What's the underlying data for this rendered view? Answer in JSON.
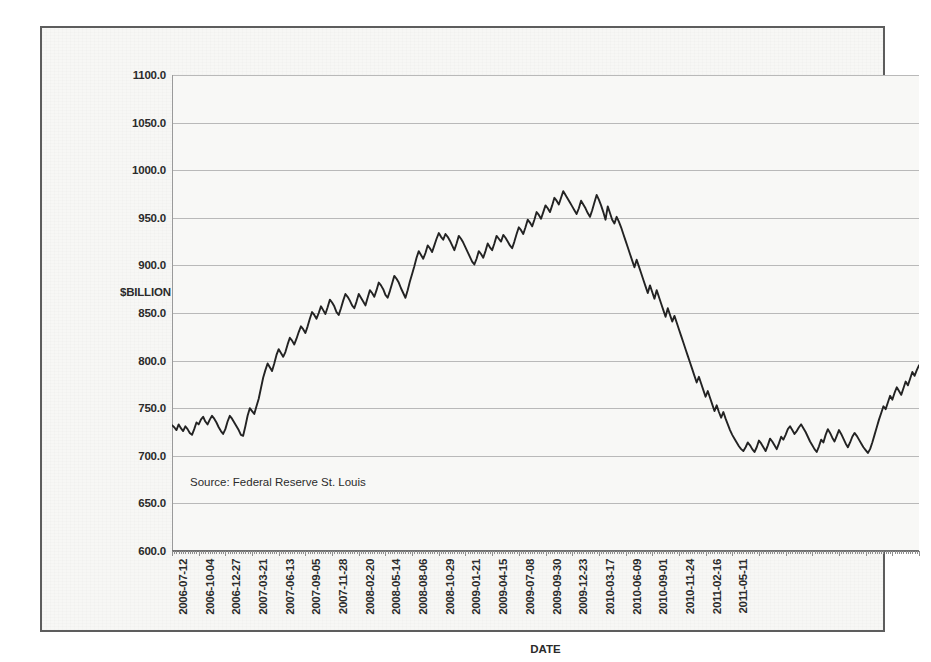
{
  "chart_data": {
    "type": "line",
    "title": "U.S. Commercial and Industrial Loans plus Non- financial Commercial Paper",
    "xlabel": "DATE",
    "ylabel": "$BILLION",
    "ylim": [
      600.0,
      1100.0
    ],
    "ytick_step": 50.0,
    "ytick_labels": [
      "1100.0",
      "1050.0",
      "1000.0",
      "950.0",
      "900.0",
      "850.0",
      "800.0",
      "750.0",
      "700.0",
      "650.0",
      "600.0"
    ],
    "ytick_values": [
      1100.0,
      1050.0,
      1000.0,
      950.0,
      900.0,
      850.0,
      800.0,
      750.0,
      700.0,
      650.0,
      600.0
    ],
    "grid": true,
    "legend": "none",
    "annotation": "Source: Federal Reserve St. Louis",
    "line_color": "#232323",
    "xtick_labels": [
      "2006-07-12",
      "2006-10-04",
      "2006-12-27",
      "2007-03-21",
      "2007-06-13",
      "2007-09-05",
      "2007-11-28",
      "2008-02-20",
      "2008-05-14",
      "2008-08-06",
      "2008-10-29",
      "2009-01-21",
      "2009-04-15",
      "2009-07-08",
      "2009-09-30",
      "2009-12-23",
      "2010-03-17",
      "2010-06-09",
      "2010-09-01",
      "2010-11-24",
      "2011-02-16",
      "2011-05-11"
    ],
    "x_start": "2006-07-12",
    "x_end": "2011-07-27",
    "x_interval": "weekly",
    "n_points": 260,
    "values": [
      732,
      730,
      727,
      733,
      729,
      726,
      731,
      728,
      724,
      722,
      728,
      735,
      733,
      738,
      741,
      736,
      733,
      738,
      742,
      739,
      735,
      730,
      726,
      723,
      728,
      736,
      742,
      739,
      735,
      731,
      727,
      722,
      721,
      731,
      742,
      750,
      747,
      744,
      752,
      760,
      771,
      782,
      790,
      797,
      793,
      789,
      797,
      806,
      812,
      808,
      804,
      809,
      817,
      824,
      821,
      817,
      823,
      830,
      836,
      833,
      829,
      836,
      844,
      851,
      848,
      844,
      850,
      857,
      853,
      849,
      856,
      864,
      861,
      857,
      851,
      848,
      855,
      863,
      870,
      867,
      863,
      858,
      855,
      862,
      870,
      866,
      862,
      858,
      866,
      874,
      871,
      867,
      874,
      882,
      879,
      875,
      869,
      866,
      873,
      881,
      889,
      886,
      882,
      876,
      871,
      866,
      874,
      883,
      891,
      899,
      908,
      915,
      911,
      907,
      913,
      921,
      918,
      914,
      921,
      928,
      934,
      930,
      927,
      933,
      930,
      926,
      921,
      916,
      923,
      931,
      928,
      924,
      919,
      914,
      909,
      904,
      901,
      907,
      915,
      912,
      908,
      915,
      923,
      919,
      916,
      923,
      931,
      928,
      925,
      932,
      929,
      925,
      921,
      918,
      925,
      933,
      940,
      937,
      933,
      940,
      948,
      945,
      941,
      948,
      956,
      953,
      949,
      956,
      963,
      960,
      956,
      963,
      971,
      968,
      964,
      971,
      978,
      974,
      970,
      966,
      962,
      958,
      954,
      960,
      968,
      964,
      960,
      955,
      951,
      958,
      966,
      974,
      969,
      963,
      956,
      948,
      962,
      955,
      948,
      944,
      951,
      946,
      940,
      933,
      926,
      919,
      912,
      905,
      898,
      906,
      899,
      892,
      885,
      878,
      871,
      879,
      872,
      865,
      874,
      867,
      860,
      853,
      846,
      855,
      848,
      841,
      847,
      840,
      833,
      826,
      819,
      812,
      805,
      798,
      791,
      784,
      777,
      783,
      776,
      769,
      762,
      768,
      761,
      754,
      747,
      753,
      746,
      740,
      746,
      739,
      733,
      727,
      722,
      718,
      714,
      710,
      707,
      705,
      709,
      714
    ],
    "tail_values": [
      711,
      707,
      704,
      709,
      716,
      713,
      709,
      705,
      711,
      718,
      715,
      711,
      707,
      713,
      720,
      717,
      722,
      728,
      731,
      727,
      723,
      726,
      730,
      733,
      729,
      725,
      720,
      715,
      711,
      707,
      704,
      710,
      717,
      714,
      722,
      728,
      724,
      719,
      715,
      721,
      727,
      723,
      718,
      713,
      709,
      714,
      720,
      724,
      721,
      717,
      713,
      709,
      706,
      703,
      707,
      714,
      722,
      730,
      738,
      745,
      752,
      749,
      756,
      763,
      759,
      766,
      772,
      768,
      764,
      771,
      778,
      774,
      781,
      788,
      784,
      790,
      795
    ]
  }
}
